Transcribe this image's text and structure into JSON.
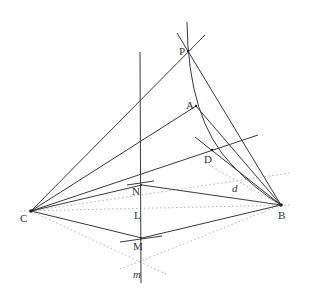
{
  "diagram": {
    "type": "geometric-construction",
    "points": {
      "P": {
        "label": "P",
        "x": 188,
        "y": 51
      },
      "A": {
        "label": "A",
        "x": 196,
        "y": 106
      },
      "D": {
        "label": "D",
        "x": 212,
        "y": 150
      },
      "B": {
        "label": "B",
        "x": 281,
        "y": 205
      },
      "C": {
        "label": "C",
        "x": 31,
        "y": 211
      },
      "N": {
        "label": "N",
        "x": 142,
        "y": 185
      },
      "L": {
        "label": "L",
        "x": 142,
        "y": 213
      },
      "M": {
        "label": "M",
        "x": 142,
        "y": 238
      }
    },
    "line_labels": {
      "d": "d",
      "m": "m"
    },
    "colors": {
      "solid_line": "#3a3a3a",
      "dotted_line": "#b5b5b5",
      "background": "#ffffff"
    }
  }
}
